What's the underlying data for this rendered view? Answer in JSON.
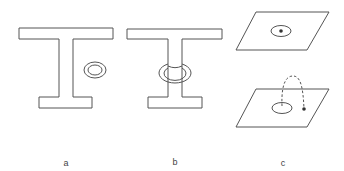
{
  "figure": {
    "panels": [
      {
        "label": "a",
        "description": "I-shaped surface with separate ring beside it"
      },
      {
        "label": "b",
        "description": "I-shaped surface with ring linked around its stem"
      },
      {
        "label": "c",
        "description": "Two planes: upper with ellipse and point inside; lower with ellipse and point outside joined by dashed arc"
      }
    ]
  },
  "colors": {
    "stroke": "#555555",
    "background": "#ffffff"
  }
}
